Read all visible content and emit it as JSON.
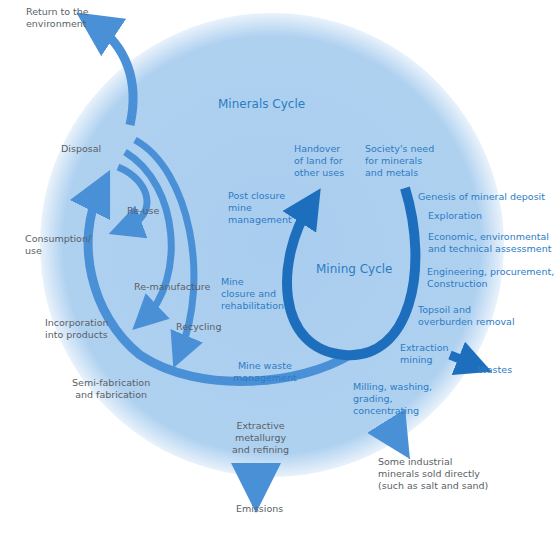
{
  "colors": {
    "circle_fill": "#a9cdef",
    "circle_edge": "#ffffff",
    "arrow_light": "#4a90d6",
    "arrow_dark": "#1d6fbe",
    "blue_text": "#2c7cc4",
    "grey_text": "#5a5f66"
  },
  "titles": {
    "minerals_cycle": "Minerals Cycle",
    "mining_cycle": "Mining Cycle"
  },
  "minerals_cycle_labels": {
    "return_to_environment": "Return to the\nenvironment",
    "disposal": "Disposal",
    "re_use": "Re-use",
    "consumption_use": "Consumption/\nuse",
    "re_manufacture": "Re-manufacture",
    "recycling": "Recycling",
    "incorporation": "Incorporation\ninto products",
    "semi_fabrication": "Semi-fabrication\nand fabrication",
    "extractive_metallurgy": "Extractive\nmetallurgy\nand refining",
    "emissions": "Emissions",
    "some_industrial": "Some industrial\nminerals sold directly\n(such as salt and sand)"
  },
  "mining_cycle_labels": {
    "handover": "Handover\nof land for\nother uses",
    "societys_need": "Society's need\nfor minerals\nand metals",
    "genesis": "Genesis of mineral deposit",
    "exploration": "Exploration",
    "assessment": "Economic, environmental\nand technical assessment",
    "engineering": "Engineering, procurement,\nConstruction",
    "topsoil": "Topsoil and\noverburden removal",
    "extraction": "Extraction\nmining",
    "wastes": "Wastes",
    "milling": "Milling, washing,\ngrading,\nconcentrating",
    "post_closure": "Post closure\nmine\nmanagement",
    "mine_closure": "Mine\nclosure and\nrehabilitation",
    "mine_waste": "Mine waste\nmanagement"
  }
}
